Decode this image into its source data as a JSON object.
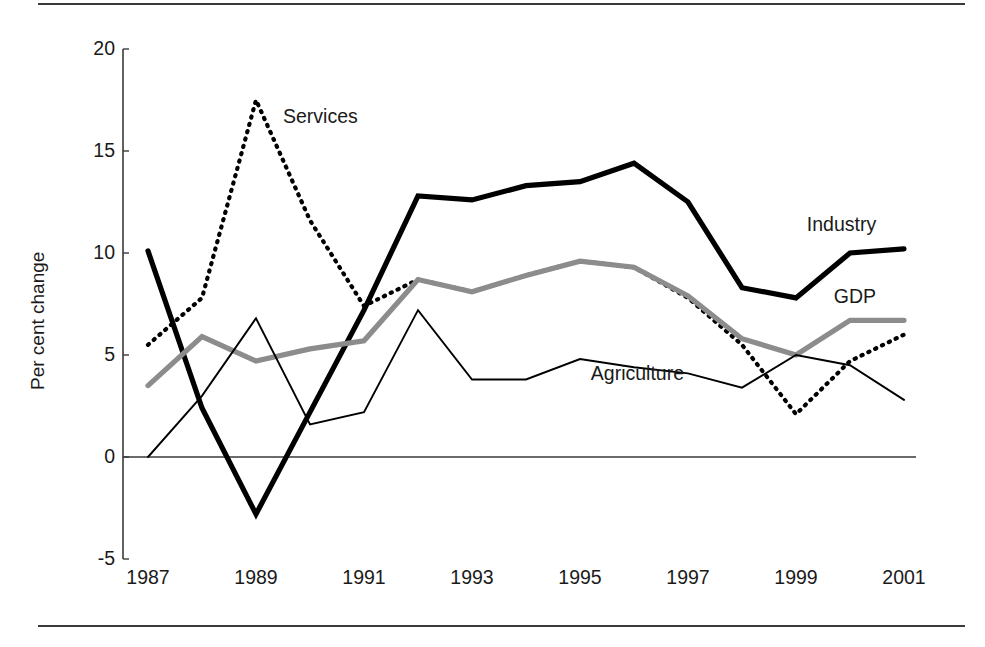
{
  "chart_data": {
    "type": "line",
    "title": "",
    "xlabel": "",
    "ylabel": "Per cent change",
    "x": [
      1987,
      1988,
      1989,
      1990,
      1991,
      1992,
      1993,
      1994,
      1995,
      1996,
      1997,
      1998,
      1999,
      2000,
      2001
    ],
    "xtick_labels": [
      "1987",
      "1989",
      "1991",
      "1993",
      "1995",
      "1997",
      "1999",
      "2001"
    ],
    "xticks": [
      1987,
      1989,
      1991,
      1993,
      1995,
      1997,
      1999,
      2001
    ],
    "ytick_labels": [
      "20",
      "15",
      "10",
      "5",
      "0",
      "-5"
    ],
    "yticks": [
      20,
      15,
      10,
      5,
      0,
      -5
    ],
    "ylim": [
      -5,
      20
    ],
    "xlim": [
      1987,
      2001
    ],
    "grid": false,
    "legend_position": "inline-annotations",
    "zero_line": true,
    "series": [
      {
        "name": "Industry",
        "style": "thick-solid-black",
        "color": "#000000",
        "values": [
          10.1,
          2.4,
          -2.8,
          2.2,
          7.2,
          12.8,
          12.6,
          13.3,
          13.5,
          14.4,
          12.5,
          8.3,
          7.8,
          10.0,
          10.2
        ]
      },
      {
        "name": "Services",
        "style": "dotted-black",
        "color": "#000000",
        "values": [
          5.5,
          7.8,
          17.5,
          11.6,
          7.4,
          8.7,
          8.1,
          8.9,
          9.6,
          9.3,
          7.8,
          5.5,
          2.1,
          4.7,
          6.0
        ]
      },
      {
        "name": "GDP",
        "style": "thick-solid-gray",
        "color": "#8c8c8c",
        "values": [
          3.5,
          5.9,
          4.7,
          5.3,
          5.7,
          8.7,
          8.1,
          8.9,
          9.6,
          9.3,
          7.9,
          5.8,
          5.0,
          6.7,
          6.7
        ]
      },
      {
        "name": "Agriculture",
        "style": "thin-solid-black",
        "color": "#000000",
        "values": [
          0.0,
          3.0,
          6.8,
          1.6,
          2.2,
          7.2,
          3.8,
          3.8,
          4.8,
          4.4,
          4.1,
          3.4,
          5.0,
          4.5,
          2.8
        ]
      }
    ],
    "annotations": [
      {
        "text": "Services",
        "x": 1989.5,
        "y": 16.6
      },
      {
        "text": "Industry",
        "x": 1999.2,
        "y": 11.3
      },
      {
        "text": "GDP",
        "x": 1999.7,
        "y": 7.8
      },
      {
        "text": "Agriculture",
        "x": 1995.2,
        "y": 4.0
      }
    ]
  }
}
